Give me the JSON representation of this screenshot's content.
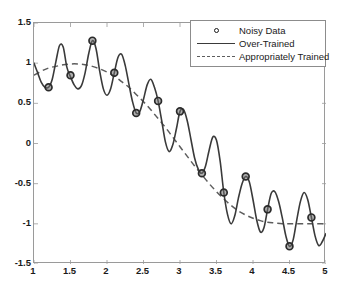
{
  "chart_data": {
    "type": "line",
    "title": "",
    "xlabel": "",
    "ylabel": "",
    "xlim": [
      1,
      5
    ],
    "ylim": [
      -1.5,
      1.5
    ],
    "xticks": [
      "1",
      "1.5",
      "2",
      "2.5",
      "3",
      "3.5",
      "4",
      "4.5",
      "5"
    ],
    "xtick_values": [
      1,
      1.5,
      2,
      2.5,
      3,
      3.5,
      4,
      4.5,
      5
    ],
    "yticks": [
      "1.5",
      "1",
      "0.5",
      "0",
      "-0.5",
      "-1",
      "-1.5"
    ],
    "ytick_values": [
      1.5,
      1,
      0.5,
      0,
      -0.5,
      -1,
      -1.5
    ],
    "grid": false,
    "legend_position": "top-right",
    "series": [
      {
        "name": "Noisy Data",
        "type": "scatter",
        "marker": "circle",
        "color": "#2b2b2b",
        "x": [
          1.2,
          1.5,
          1.8,
          2.1,
          2.4,
          2.7,
          3.0,
          3.3,
          3.6,
          3.9,
          4.2,
          4.5,
          4.8
        ],
        "y": [
          0.7,
          0.85,
          1.28,
          0.88,
          0.38,
          0.53,
          0.4,
          -0.37,
          -0.61,
          -0.41,
          -0.82,
          -1.28,
          -0.92
        ]
      },
      {
        "name": "Over-Trained",
        "type": "line",
        "style": "solid",
        "color": "#3a3a3a",
        "description": "High-frequency oscillating fit passing through every noisy data point",
        "x": [
          1.0,
          1.05,
          1.1,
          1.15,
          1.2,
          1.25,
          1.3,
          1.35,
          1.4,
          1.45,
          1.5,
          1.55,
          1.6,
          1.65,
          1.7,
          1.75,
          1.8,
          1.85,
          1.9,
          1.95,
          2.0,
          2.05,
          2.1,
          2.15,
          2.2,
          2.25,
          2.3,
          2.35,
          2.4,
          2.45,
          2.5,
          2.55,
          2.6,
          2.65,
          2.7,
          2.75,
          2.8,
          2.85,
          2.9,
          2.95,
          3.0,
          3.05,
          3.1,
          3.15,
          3.2,
          3.25,
          3.3,
          3.35,
          3.4,
          3.45,
          3.5,
          3.55,
          3.6,
          3.65,
          3.7,
          3.75,
          3.8,
          3.85,
          3.9,
          3.95,
          4.0,
          4.05,
          4.1,
          4.15,
          4.2,
          4.25,
          4.3,
          4.35,
          4.4,
          4.45,
          4.5,
          4.55,
          4.6,
          4.65,
          4.7,
          4.75,
          4.8,
          4.85,
          4.9,
          4.95,
          5.0
        ],
        "y": [
          1.0,
          0.88,
          0.76,
          0.7,
          0.7,
          0.8,
          1.02,
          1.22,
          1.2,
          0.95,
          0.83,
          0.73,
          0.68,
          0.72,
          0.88,
          1.12,
          1.28,
          1.18,
          0.9,
          0.68,
          0.6,
          0.68,
          0.88,
          1.07,
          1.11,
          0.97,
          0.74,
          0.52,
          0.38,
          0.4,
          0.55,
          0.73,
          0.8,
          0.7,
          0.53,
          0.28,
          0.02,
          -0.1,
          -0.02,
          0.18,
          0.4,
          0.42,
          0.28,
          0.05,
          -0.18,
          -0.32,
          -0.37,
          -0.28,
          -0.08,
          0.08,
          0.04,
          -0.22,
          -0.61,
          -0.88,
          -1.0,
          -0.9,
          -0.68,
          -0.5,
          -0.41,
          -0.48,
          -0.7,
          -0.95,
          -1.1,
          -1.05,
          -0.82,
          -0.62,
          -0.6,
          -0.72,
          -0.92,
          -1.15,
          -1.28,
          -1.2,
          -0.95,
          -0.72,
          -0.61,
          -0.7,
          -0.92,
          -1.15,
          -1.27,
          -1.22,
          -1.12
        ]
      },
      {
        "name": "Appropriately Trained",
        "type": "line",
        "style": "dashed",
        "color": "#5d5d5d",
        "description": "Smooth low-order fit following the underlying decaying trend",
        "x": [
          1.0,
          1.1,
          1.2,
          1.3,
          1.4,
          1.5,
          1.6,
          1.7,
          1.8,
          1.9,
          2.0,
          2.1,
          2.2,
          2.3,
          2.4,
          2.5,
          2.6,
          2.7,
          2.8,
          2.9,
          3.0,
          3.1,
          3.2,
          3.3,
          3.4,
          3.5,
          3.6,
          3.7,
          3.8,
          3.9,
          4.0,
          4.1,
          4.2,
          4.3,
          4.4,
          4.5,
          4.6,
          4.7,
          4.8,
          4.9,
          5.0
        ],
        "y": [
          0.85,
          0.9,
          0.94,
          0.96,
          0.98,
          0.99,
          0.99,
          0.98,
          0.96,
          0.93,
          0.89,
          0.84,
          0.77,
          0.7,
          0.61,
          0.52,
          0.42,
          0.31,
          0.2,
          0.08,
          -0.04,
          -0.16,
          -0.28,
          -0.39,
          -0.5,
          -0.6,
          -0.69,
          -0.77,
          -0.84,
          -0.89,
          -0.93,
          -0.96,
          -0.98,
          -0.99,
          -1.0,
          -1.0,
          -1.0,
          -1.0,
          -1.0,
          -1.0,
          -1.0
        ]
      }
    ]
  },
  "legend": {
    "items": [
      {
        "label": "Noisy Data",
        "glyph": "circle-marker-icon"
      },
      {
        "label": "Over-Trained",
        "glyph": "solid-line-icon"
      },
      {
        "label": "Appropriately Trained",
        "glyph": "dashed-line-icon"
      }
    ]
  },
  "colors": {
    "background": "#ffffff",
    "axis": "#9a9a9a",
    "tick_text": "#1a1a1a",
    "overtrained_line": "#3a3a3a",
    "appropriate_line": "#5d5d5d",
    "marker_edge": "#2b2b2b"
  }
}
